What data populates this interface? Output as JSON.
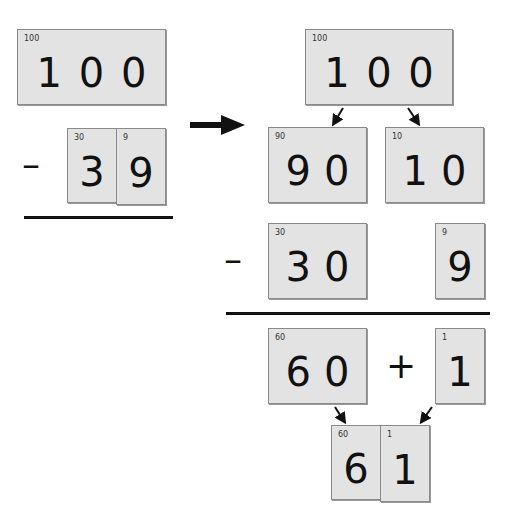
{
  "left": {
    "minuend": {
      "label": "100",
      "digits": [
        "1",
        "0",
        "0"
      ]
    },
    "operator": "–",
    "subtrahend": [
      {
        "label": "30",
        "digit": "3"
      },
      {
        "label": "9",
        "digit": "9"
      }
    ]
  },
  "right": {
    "top": {
      "label": "100",
      "digits": [
        "1",
        "0",
        "0"
      ]
    },
    "split": [
      {
        "label": "90",
        "digits": [
          "9",
          "0"
        ]
      },
      {
        "label": "10",
        "digits": [
          "1",
          "0"
        ]
      }
    ],
    "operator_minus": "–",
    "subtract": [
      {
        "label": "30",
        "digits": [
          "3",
          "0"
        ]
      },
      {
        "label": "9",
        "digits": [
          "9"
        ]
      }
    ],
    "results": [
      {
        "label": "60",
        "digits": [
          "6",
          "0"
        ]
      },
      {
        "label": "1",
        "digits": [
          "1"
        ]
      }
    ],
    "operator_plus": "+",
    "final": [
      {
        "label": "60",
        "digit": "6"
      },
      {
        "label": "1",
        "digit": "1"
      }
    ]
  }
}
